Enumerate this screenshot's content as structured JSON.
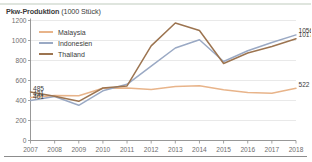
{
  "card": {
    "title_main": "Pkw-Produktion",
    "title_unit": "(1000 Stück)"
  },
  "legend": {
    "position": "top-left-inside",
    "items": [
      {
        "label": "Malaysia",
        "color": "#e8b48a"
      },
      {
        "label": "Indonesien",
        "color": "#9aa9c4"
      },
      {
        "label": "Thailand",
        "color": "#9c7450"
      }
    ]
  },
  "axes": {
    "y_ticks": [
      "0",
      "200",
      "400",
      "600",
      "800",
      "1000",
      "1200"
    ],
    "x_ticks": [
      "2007",
      "2008",
      "2009",
      "2010",
      "2011",
      "2012",
      "2013",
      "2014",
      "2015",
      "2016",
      "2017",
      "2018"
    ]
  },
  "labels": {
    "start": [
      {
        "text": "485",
        "series": "Thailand"
      },
      {
        "text": "431",
        "series": "Malaysia"
      },
      {
        "text": "401",
        "series": "Indonesien"
      }
    ],
    "end": [
      {
        "text": "1056",
        "series": "Indonesien"
      },
      {
        "text": "1017",
        "series": "Thailand"
      },
      {
        "text": "522",
        "series": "Malaysia"
      }
    ]
  },
  "chart_data": {
    "type": "line",
    "title": "Pkw-Produktion (1000 Stück)",
    "xlabel": "",
    "ylabel": "1000 Stück",
    "ylim": [
      0,
      1200
    ],
    "grid": true,
    "legend_position": "top-left",
    "categories": [
      "2007",
      "2008",
      "2009",
      "2010",
      "2011",
      "2012",
      "2013",
      "2014",
      "2015",
      "2016",
      "2017",
      "2018"
    ],
    "series": [
      {
        "name": "Malaysia",
        "color": "#e8b48a",
        "values": [
          431,
          450,
          447,
          523,
          524,
          510,
          540,
          547,
          508,
          480,
          472,
          522
        ],
        "start_label": 431,
        "end_label": 522
      },
      {
        "name": "Indonesien",
        "color": "#9aa9c4",
        "values": [
          401,
          440,
          352,
          497,
          562,
          743,
          925,
          1008,
          790,
          898,
          980,
          1056
        ],
        "start_label": 401,
        "end_label": 1056
      },
      {
        "name": "Thailand",
        "color": "#9c7450",
        "values": [
          485,
          443,
          392,
          525,
          546,
          946,
          1175,
          1100,
          770,
          875,
          940,
          1017
        ],
        "start_label": 485,
        "end_label": 1017
      }
    ]
  }
}
